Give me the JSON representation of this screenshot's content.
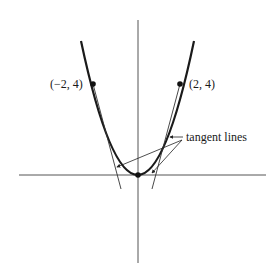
{
  "figure": {
    "curve_equation": "y = x^2",
    "points": [
      {
        "label": "(−2, 4)",
        "x": -2,
        "y": 4
      },
      {
        "label": "(2, 4)",
        "x": 2,
        "y": 4
      },
      {
        "label": "",
        "x": 0,
        "y": 0
      }
    ],
    "annotation": "tangent lines",
    "colors": {
      "ink": "#1a1a1a",
      "axis": "#555555",
      "background": "#ffffff"
    }
  }
}
